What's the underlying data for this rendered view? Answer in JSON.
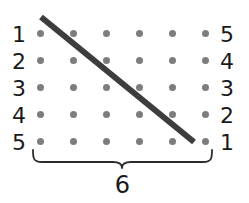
{
  "figure": {
    "background_color": "#ffffff"
  },
  "grid": {
    "rows": 5,
    "columns": 6,
    "dot_color": "#7d7d7d",
    "dot_diameter_px": 7,
    "origin_x": 37,
    "origin_y": 30,
    "step_x": 33,
    "step_y": 27
  },
  "left_labels": {
    "name": "row-labels-left",
    "values": [
      "1",
      "2",
      "3",
      "4",
      "5"
    ],
    "color": "#1a1a1a"
  },
  "right_labels": {
    "name": "row-labels-right",
    "values": [
      "5",
      "4",
      "3",
      "2",
      "1"
    ],
    "color": "#1a1a1a"
  },
  "diagonal": {
    "name": "diagonal-line",
    "color": "#3d3d3d",
    "width_px": 6,
    "x1": 41,
    "y1": 17,
    "x2": 194,
    "y2": 142
  },
  "brace": {
    "name": "bottom-brace",
    "color": "#2b2b2b",
    "left_x": 33,
    "right_x": 212,
    "top_y": 150,
    "bottom_y": 164,
    "tip_x": 122
  },
  "count_label": {
    "text": "6"
  }
}
